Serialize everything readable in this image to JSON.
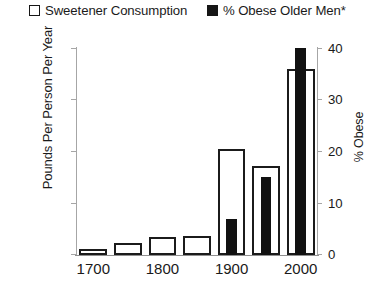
{
  "legend": {
    "entries": [
      {
        "label": "Sweetener Consumption",
        "swatch": "hollow-square-icon",
        "color": "#ffffff"
      },
      {
        "label": "% Obese Older Men*",
        "swatch": "filled-square-icon",
        "color": "#111111"
      }
    ]
  },
  "axes": {
    "left": {
      "title": "Pounds Per Person Per Year",
      "ticks": [
        "0",
        "40",
        "80",
        "120",
        "160"
      ]
    },
    "right": {
      "title": "% Obese",
      "ticks": [
        "0",
        "10",
        "20",
        "30",
        "40"
      ]
    },
    "bottom": {
      "ticks": [
        "1700",
        "1800",
        "1900",
        "2000"
      ]
    }
  },
  "chart_data": {
    "type": "bar",
    "title": "",
    "xlabel": "",
    "ylabel": "Pounds Per Person Per Year",
    "y2label": "% Obese",
    "categories": [
      "1700",
      "1750",
      "1800",
      "1850",
      "1900",
      "1950",
      "2000"
    ],
    "xtick_labels": [
      "1700",
      "1800",
      "1900",
      "2000"
    ],
    "xtick_categories": [
      "1700",
      "1800",
      "1900",
      "2000"
    ],
    "ylim": [
      0,
      160
    ],
    "yticks": [
      0,
      40,
      80,
      120,
      160
    ],
    "y2lim": [
      0,
      40
    ],
    "y2ticks": [
      0,
      10,
      20,
      30,
      40
    ],
    "grid": false,
    "legend_position": "top",
    "series": [
      {
        "name": "Sweetener Consumption",
        "axis": "left",
        "style": "hollow",
        "color": "#ffffff",
        "edgecolor": "#1b1b1b",
        "units": "Pounds Per Person Per Year",
        "values": [
          5,
          9,
          14,
          15,
          82,
          69,
          144
        ]
      },
      {
        "name": "% Obese Older Men*",
        "axis": "right",
        "style": "filled",
        "color": "#111111",
        "edgecolor": "#111111",
        "units": "% Obese",
        "values": [
          null,
          null,
          null,
          null,
          7,
          15,
          40
        ]
      }
    ]
  }
}
